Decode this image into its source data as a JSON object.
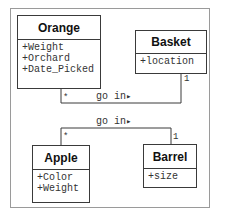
{
  "diagram": {
    "type": "UML class diagram",
    "classes": [
      {
        "name": "Orange",
        "attributes": [
          "+Weight",
          "+Orchard",
          "+Date_Picked"
        ]
      },
      {
        "name": "Basket",
        "attributes": [
          "+location"
        ]
      },
      {
        "name": "Apple",
        "attributes": [
          "+Color",
          "+Weight"
        ]
      },
      {
        "name": "Barrel",
        "attributes": [
          "+size"
        ]
      }
    ],
    "associations": [
      {
        "from": "Orange",
        "to": "Basket",
        "label": "go in",
        "direction_glyph": "▸",
        "from_multiplicity": "*",
        "to_multiplicity": "1"
      },
      {
        "from": "Apple",
        "to": "Barrel",
        "label": "go in",
        "direction_glyph": "▸",
        "from_multiplicity": "*",
        "to_multiplicity": "1"
      }
    ]
  }
}
